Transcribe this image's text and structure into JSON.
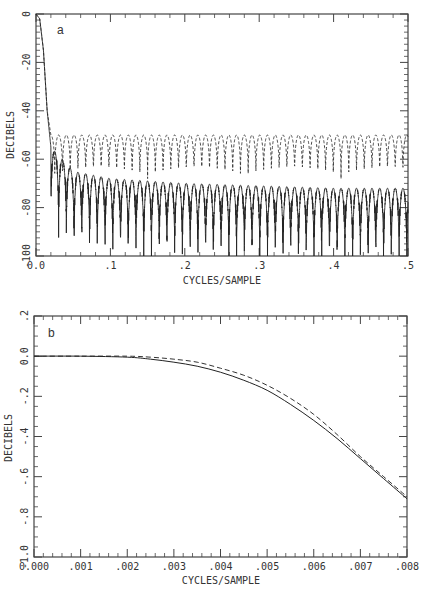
{
  "chart_data": [
    {
      "id": "a",
      "type": "line",
      "panel_label": "a",
      "title": "",
      "xlabel": "CYCLES/SAMPLE",
      "ylabel": "DECIBELS",
      "xlim": [
        0.0,
        0.5
      ],
      "ylim": [
        -100,
        0
      ],
      "x_tick_labels": [
        "0.0",
        ".1",
        ".2",
        ".3",
        ".4",
        ".5"
      ],
      "x_ticks": [
        0.0,
        0.1,
        0.2,
        0.3,
        0.4,
        0.5
      ],
      "y_tick_labels": [
        "0",
        "-20",
        "-40",
        "-60",
        "-80",
        "-100"
      ],
      "y_ticks": [
        0,
        -20,
        -40,
        -60,
        -80,
        -100
      ],
      "grid": false,
      "legend": null,
      "series": [
        {
          "name": "solid",
          "style": "solid",
          "description": "Lowpass response: passband ~0 dB to ~0.01, steep transition to ~-55 dB near 0.02, then oscillating sidelobes with peaks decaying from ~-55 dB to ~-72 dB and nulls reaching below -100 dB",
          "x": [
            0.0,
            0.005,
            0.01,
            0.015,
            0.02,
            0.05,
            0.1,
            0.2,
            0.3,
            0.4,
            0.5
          ],
          "peak_values": [
            0,
            -2,
            -15,
            -40,
            -55,
            -65,
            -68,
            -70,
            -71,
            -72,
            -72
          ]
        },
        {
          "name": "dashed",
          "style": "dashed",
          "description": "Lowpass response with equiripple stopband: sidelobe peaks ~-50 dB across 0.02-0.5, nulls ~-65 to -70 dB",
          "x": [
            0.0,
            0.005,
            0.01,
            0.015,
            0.02,
            0.05,
            0.1,
            0.2,
            0.3,
            0.4,
            0.5
          ],
          "peak_values": [
            0,
            -2,
            -15,
            -40,
            -50,
            -50,
            -50,
            -50,
            -50,
            -50,
            -50
          ]
        }
      ]
    },
    {
      "id": "b",
      "type": "line",
      "panel_label": "b",
      "title": "",
      "xlabel": "CYCLES/SAMPLE",
      "ylabel": "DECIBELS",
      "xlim": [
        0.0,
        0.008
      ],
      "ylim": [
        -1.0,
        0.2
      ],
      "x_tick_labels": [
        "0.000",
        ".001",
        ".002",
        ".003",
        ".004",
        ".005",
        ".006",
        ".007",
        ".008"
      ],
      "x_ticks": [
        0.0,
        0.001,
        0.002,
        0.003,
        0.004,
        0.005,
        0.006,
        0.007,
        0.008
      ],
      "y_tick_labels": [
        ".2",
        "0.0",
        "-.2",
        "-.4",
        "-.6",
        "-.8",
        "-1.0"
      ],
      "y_ticks": [
        0.2,
        0.0,
        -0.2,
        -0.4,
        -0.6,
        -0.8,
        -1.0
      ],
      "grid": false,
      "legend": null,
      "series": [
        {
          "name": "solid",
          "style": "solid",
          "x": [
            0.0,
            0.001,
            0.002,
            0.0025,
            0.003,
            0.0035,
            0.004,
            0.0045,
            0.005,
            0.0055,
            0.006,
            0.0065,
            0.007,
            0.0075,
            0.008
          ],
          "values": [
            0.0,
            0.0,
            -0.005,
            -0.015,
            -0.03,
            -0.05,
            -0.08,
            -0.12,
            -0.17,
            -0.24,
            -0.32,
            -0.41,
            -0.51,
            -0.61,
            -0.71
          ]
        },
        {
          "name": "dashed",
          "style": "dashed",
          "x": [
            0.0,
            0.001,
            0.002,
            0.0025,
            0.003,
            0.0035,
            0.004,
            0.0045,
            0.005,
            0.0055,
            0.006,
            0.0065,
            0.007,
            0.0075,
            0.008
          ],
          "values": [
            0.0,
            0.0,
            0.0,
            -0.005,
            -0.015,
            -0.03,
            -0.06,
            -0.095,
            -0.145,
            -0.21,
            -0.29,
            -0.39,
            -0.5,
            -0.6,
            -0.7
          ]
        }
      ]
    }
  ]
}
